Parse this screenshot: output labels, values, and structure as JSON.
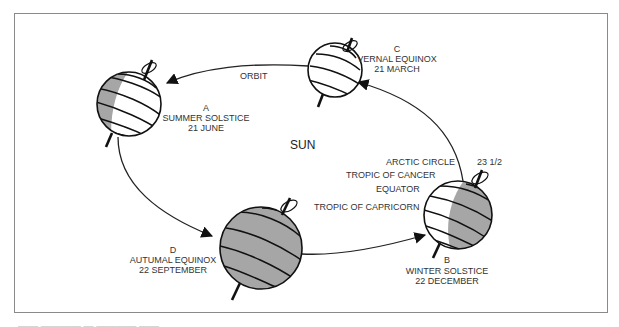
{
  "diagram": {
    "colors": {
      "frame": "#8a8a8a",
      "shadow": "#a6a6a6",
      "ink": "#111111",
      "text": "#333333"
    },
    "center_label": "SUN",
    "orbit_label": "ORBIT",
    "tilt_label": "23 1/2",
    "latitude_labels": {
      "arctic_circle": "ARCTIC CIRCLE",
      "tropic_of_cancer": "TROPIC OF CANCER",
      "equator": "EQUATOR",
      "tropic_of_capricorn": "TROPIC OF CAPRICORN"
    },
    "positions": {
      "A": {
        "letter": "A",
        "name": "SUMMER SOLSTICE",
        "date": "21 JUNE"
      },
      "B": {
        "letter": "B",
        "name": "WINTER SOLSTICE",
        "date": "22 DECEMBER"
      },
      "C": {
        "letter": "C",
        "name": "VERNAL EQUINOX",
        "date": "21 MARCH"
      },
      "D": {
        "letter": "D",
        "name": "AUTUMAL EQUINOX",
        "date": "22 SEPTEMBER"
      }
    }
  }
}
